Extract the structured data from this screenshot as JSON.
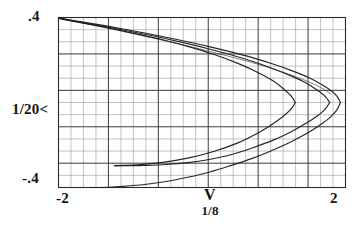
{
  "figure": {
    "kind": "line-plot",
    "background": "#ffffff",
    "ink_color": "#1a1a1a",
    "grid_color_minor": "#9a9a9a",
    "grid_color_major": "#3c3c3c",
    "frame_color": "#2b2b2b"
  },
  "axes": {
    "y_top_label": ".4",
    "y_bottom_label": "-.4",
    "y_axis_label": "1/20<",
    "x_left_label": "-2",
    "x_right_label": "2",
    "x_axis_label": "V",
    "x_axis_sublabel": "1/8"
  },
  "chart_data": {
    "type": "line",
    "title": "",
    "xlabel": "V",
    "xlabel_sub": "1/8",
    "ylabel": "1/20<",
    "xlim": [
      -2,
      2
    ],
    "ylim": [
      -0.4,
      0.4
    ],
    "xticks": [
      -2,
      2
    ],
    "xticklabels": [
      "-2",
      "2"
    ],
    "yticks": [
      -0.4,
      0.4
    ],
    "yticklabels": [
      "-.4",
      ".4"
    ],
    "grid": true,
    "grid_columns": 23,
    "grid_rows": 14,
    "grid_major_every_columns": 4,
    "grid_major_every_rows": 3,
    "legend": "none",
    "annotations": [],
    "series": [
      {
        "name": "outer-branch-upper",
        "comment": "leftward-opening parabola, outermost; vertex near V=1.93",
        "x": [
          -2.0,
          -1.7,
          -1.4,
          -1.1,
          -0.8,
          -0.5,
          -0.2,
          0.1,
          0.4,
          0.7,
          1.0,
          1.25,
          1.5,
          1.68,
          1.8,
          1.88,
          1.93
        ],
        "y": [
          0.398,
          0.381,
          0.364,
          0.346,
          0.327,
          0.307,
          0.286,
          0.263,
          0.238,
          0.211,
          0.18,
          0.15,
          0.115,
          0.082,
          0.055,
          0.03,
          0.0
        ]
      },
      {
        "name": "outer-branch-lower",
        "comment": "mirror of outer-branch-upper, reaches -.4 near V=-1.55",
        "x": [
          1.93,
          1.88,
          1.8,
          1.68,
          1.5,
          1.25,
          1.0,
          0.7,
          0.4,
          0.1,
          -0.2,
          -0.5,
          -0.8,
          -1.1,
          -1.3,
          -1.45,
          -1.55
        ],
        "y": [
          0.0,
          -0.035,
          -0.065,
          -0.098,
          -0.138,
          -0.183,
          -0.222,
          -0.263,
          -0.297,
          -0.328,
          -0.352,
          -0.372,
          -0.386,
          -0.395,
          -0.399,
          -0.4,
          -0.4
        ]
      },
      {
        "name": "middle-branch-upper",
        "comment": "second parabola, vertex near V=1.78",
        "x": [
          -2.0,
          -1.7,
          -1.4,
          -1.1,
          -0.8,
          -0.5,
          -0.2,
          0.1,
          0.4,
          0.7,
          1.0,
          1.25,
          1.45,
          1.62,
          1.72,
          1.78
        ],
        "y": [
          0.396,
          0.378,
          0.36,
          0.341,
          0.321,
          0.3,
          0.277,
          0.252,
          0.225,
          0.194,
          0.158,
          0.124,
          0.092,
          0.055,
          0.028,
          0.0
        ]
      },
      {
        "name": "middle-branch-lower",
        "comment": "mirror of middle branch, terminates near V=-1.22, y=-.29",
        "x": [
          1.78,
          1.72,
          1.62,
          1.45,
          1.25,
          1.0,
          0.7,
          0.4,
          0.1,
          -0.2,
          -0.5,
          -0.8,
          -1.0,
          -1.15,
          -1.22
        ],
        "y": [
          0.0,
          -0.03,
          -0.06,
          -0.098,
          -0.136,
          -0.176,
          -0.214,
          -0.246,
          -0.268,
          -0.283,
          -0.292,
          -0.296,
          -0.297,
          -0.297,
          -0.297
        ]
      },
      {
        "name": "inner-branch-upper",
        "comment": "innermost parabola, vertex near V=1.30",
        "x": [
          -1.95,
          -1.6,
          -1.25,
          -0.9,
          -0.55,
          -0.2,
          0.15,
          0.5,
          0.8,
          1.0,
          1.15,
          1.25,
          1.3
        ],
        "y": [
          0.392,
          0.37,
          0.347,
          0.322,
          0.295,
          0.264,
          0.228,
          0.184,
          0.138,
          0.1,
          0.06,
          0.028,
          0.0
        ]
      },
      {
        "name": "inner-branch-lower",
        "comment": "mirror of inner branch, terminates near V=-1.22",
        "x": [
          1.3,
          1.25,
          1.15,
          1.0,
          0.8,
          0.5,
          0.15,
          -0.2,
          -0.55,
          -0.9,
          -1.1,
          -1.22
        ],
        "y": [
          0.0,
          -0.028,
          -0.06,
          -0.098,
          -0.14,
          -0.19,
          -0.232,
          -0.262,
          -0.282,
          -0.293,
          -0.296,
          -0.297
        ]
      },
      {
        "name": "chord-secant",
        "comment": "near-straight light stroke across the top-left to mid-right",
        "x": [
          -1.97,
          -1.4,
          -0.8,
          -0.2,
          0.4,
          0.9,
          1.3,
          1.6,
          1.8
        ],
        "y": [
          0.396,
          0.356,
          0.312,
          0.266,
          0.215,
          0.168,
          0.122,
          0.08,
          0.04
        ]
      }
    ]
  }
}
